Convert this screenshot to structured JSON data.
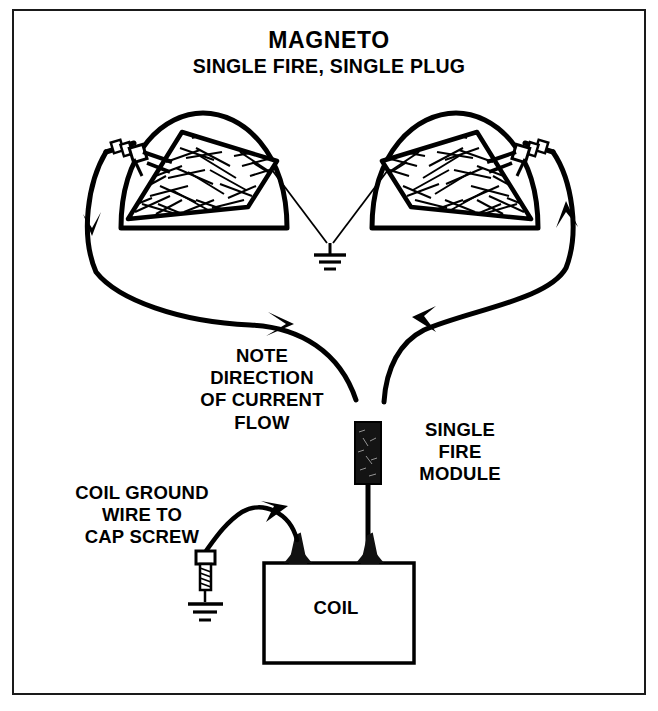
{
  "diagram": {
    "title": "MAGNETO",
    "subtitle": "SINGLE FIRE,  SINGLE PLUG",
    "labels": {
      "current_flow": "NOTE\nDIRECTION\nOF CURRENT\nFLOW",
      "single_fire_module": "SINGLE\nFIRE\nMODULE",
      "coil_ground_wire": "COIL GROUND\nWIRE TO\nCAP SCREW",
      "coil": "COIL"
    },
    "components": [
      {
        "name": "cylinder-head-left",
        "kind": "hatched-wedge",
        "description": "Left cylinder head cross-section with spark plug"
      },
      {
        "name": "cylinder-head-right",
        "kind": "hatched-wedge",
        "description": "Right cylinder head cross-section with spark plug"
      },
      {
        "name": "spark-plug-left",
        "kind": "spark-plug"
      },
      {
        "name": "spark-plug-right",
        "kind": "spark-plug"
      },
      {
        "name": "single-fire-module",
        "kind": "black-rectangle-module"
      },
      {
        "name": "coil",
        "kind": "rectangle-box"
      },
      {
        "name": "cap-screw",
        "kind": "threaded-bolt"
      },
      {
        "name": "ground-symbol-center",
        "kind": "earth-ground"
      },
      {
        "name": "ground-symbol-cap-screw",
        "kind": "earth-ground"
      }
    ],
    "flow_arrows": [
      {
        "name": "arrow-left-wire-down",
        "direction": "down"
      },
      {
        "name": "arrow-left-wire-right",
        "direction": "right"
      },
      {
        "name": "arrow-right-wire-upleft",
        "direction": "up-left"
      },
      {
        "name": "arrow-right-wire-up",
        "direction": "up"
      },
      {
        "name": "arrow-cap-screw-wire",
        "direction": "up-right"
      }
    ],
    "colors": {
      "ink": "#000000",
      "background": "#ffffff",
      "border": "#1a1a1a"
    }
  }
}
